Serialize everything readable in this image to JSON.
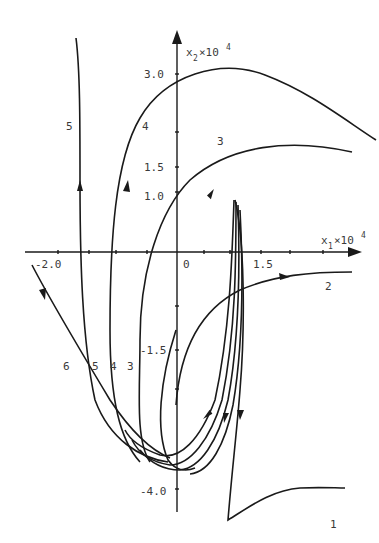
{
  "diagram": {
    "type": "phase-portrait",
    "x_axis": {
      "label": "x",
      "sub": "1",
      "suffix": "×10",
      "sup": "4",
      "ticks": [
        "-2.0",
        "0",
        "1.5"
      ]
    },
    "y_axis": {
      "label": "x",
      "sub": "2",
      "suffix": "×10",
      "sup": "4",
      "ticks": [
        "3.0",
        "1.5",
        "1.0",
        "-1.5",
        "-4.0"
      ]
    },
    "trajectories": [
      {
        "id": "1",
        "label": "1"
      },
      {
        "id": "2",
        "label": "2"
      },
      {
        "id": "3",
        "label": "3"
      },
      {
        "id": "4",
        "label": "4"
      },
      {
        "id": "5",
        "label": "5"
      },
      {
        "id": "6",
        "label": "6"
      }
    ],
    "bottom_labels": [
      "6",
      "5",
      "4",
      "3"
    ],
    "colors": {
      "ink": "#1a1a1a",
      "text": "#3a3a3a",
      "background": "#ffffff"
    }
  }
}
